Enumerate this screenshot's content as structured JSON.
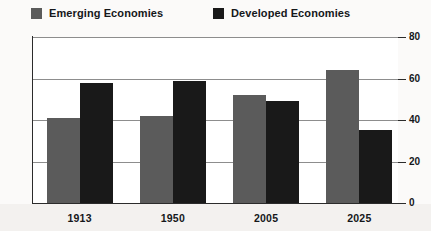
{
  "chart_data": {
    "type": "bar",
    "title": "",
    "subtitle": "",
    "xlabel": "",
    "ylabel": "",
    "categories": [
      "1913",
      "1950",
      "2005",
      "2025"
    ],
    "series": [
      {
        "name": "Emerging Economies",
        "color": "#5b5b5b",
        "values": [
          41,
          42,
          52,
          64
        ]
      },
      {
        "name": "Developed Economies",
        "color": "#191919",
        "values": [
          58,
          59,
          49,
          35
        ]
      }
    ],
    "ylim": [
      0,
      80
    ],
    "yticks": [
      0,
      20,
      40,
      60,
      80
    ],
    "ytick_labels": [
      "0",
      "20",
      "40",
      "60",
      "80"
    ],
    "grid": true,
    "grid_axis": "y",
    "legend": {
      "position": "top",
      "entries": [
        {
          "label": "Emerging Economies",
          "color": "#5b5b5b"
        },
        {
          "label": "Developed Economies",
          "color": "#191919"
        }
      ]
    },
    "axis_side": "right",
    "background": "#fbfaf9",
    "plot_background": "#ffffff"
  }
}
